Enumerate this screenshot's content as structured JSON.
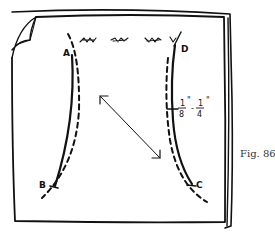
{
  "figure": {
    "caption": "Fig. 86",
    "ink_color": "#111111",
    "caption_color": "#333333",
    "points": {
      "a": "A",
      "b": "B",
      "c": "C",
      "d": "D"
    },
    "measurement": {
      "from_num": "1",
      "from_den": "8",
      "from_unit": "\"",
      "dash": "-",
      "to_num": "1",
      "to_den": "4",
      "to_unit": "\""
    },
    "elements": [
      "fabric-square-with-folded-corner",
      "seam-line-a-b",
      "cutting-line-a-b",
      "seam-line-d-c",
      "cutting-line-d-c",
      "grain-arrow",
      "gather-marks"
    ]
  }
}
